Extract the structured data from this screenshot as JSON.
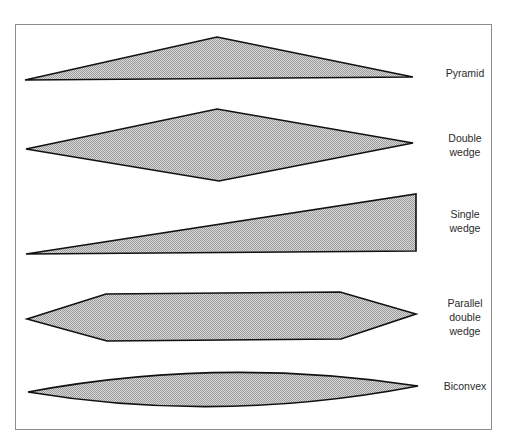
{
  "figure": {
    "shapes": [
      {
        "id": "pyramid",
        "label": "Pyramid"
      },
      {
        "id": "double-wedge",
        "label": "Double\nwedge"
      },
      {
        "id": "single-wedge",
        "label": "Single\nwedge"
      },
      {
        "id": "parallel-double-wedge",
        "label": "Parallel\ndouble\nwedge"
      },
      {
        "id": "biconvex",
        "label": "Biconvex"
      }
    ],
    "colors": {
      "fill": "#c8c8c8",
      "stroke": "#111111",
      "frame": "#8c8c8c"
    }
  }
}
